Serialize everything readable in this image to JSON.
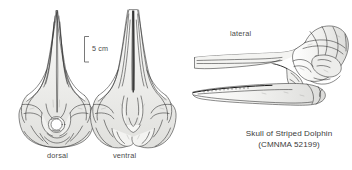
{
  "figure": {
    "background_color": "#ffffff",
    "ink_color": "#2b2b2b",
    "shade_color": "#d8d8d6",
    "text_color": "#3b3b3b",
    "views": [
      {
        "id": "dorsal",
        "label": "dorsal"
      },
      {
        "id": "ventral",
        "label": "ventral"
      },
      {
        "id": "lateral",
        "label": "lateral"
      }
    ],
    "scale_bar": {
      "label": "5 cm",
      "value": 5,
      "unit": "cm"
    },
    "caption": {
      "title": "Skull of Striped Dolphin",
      "catalog": "(CMNMA 52199)"
    }
  }
}
